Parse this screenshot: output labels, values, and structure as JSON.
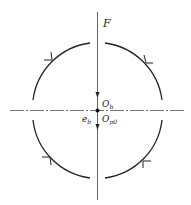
{
  "diagram": {
    "type": "circular arc loading diagram",
    "labels": {
      "force": "F",
      "center_upper_main": "O",
      "center_upper_sub": "b",
      "eccentricity_main": "e",
      "eccentricity_sub": "b",
      "center_lower_main": "O",
      "center_lower_sub": "p0"
    },
    "colors": {
      "stroke": "#222222",
      "centerline": "#555555",
      "background": "#ffffff"
    }
  }
}
